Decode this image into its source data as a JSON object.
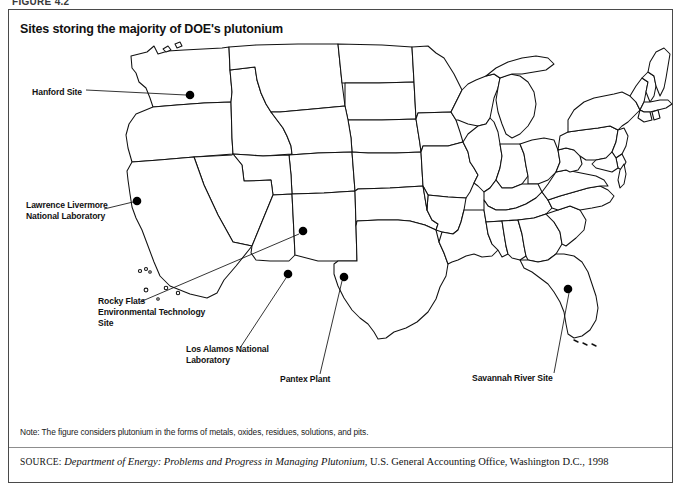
{
  "figure": {
    "number_label": "FIGURE 4.2",
    "title": "Sites storing the majority of DOE's plutonium",
    "note": "Note: The figure considers plutonium in the forms of metals, oxides, residues, solutions, and pits.",
    "source": {
      "label": "SOURCE:",
      "title": "Department of Energy: Problems and Progress in Managing Plutonium",
      "rest": ", U.S. General Accounting Office, Washington D.C., 1998"
    }
  },
  "map": {
    "region": "United States",
    "sites": [
      {
        "id": "hanford",
        "label_lines": [
          "Hanford Site"
        ],
        "label_line1": "Hanford Site",
        "label_x": 74,
        "label_y": 52,
        "anchor": "end",
        "dot_x": 182,
        "dot_y": 55,
        "leader_x1": 78,
        "leader_y1": 50,
        "leader_x2": 178,
        "leader_y2": 55
      },
      {
        "id": "lawrence-livermore",
        "label_lines": [
          "Lawrence Livermore",
          "National Laboratory"
        ],
        "label_line1": "Lawrence Livermore",
        "label_line2": "National Laboratory",
        "label_x": 18,
        "label_y": 172,
        "anchor": "start",
        "dot_x": 129,
        "dot_y": 161,
        "leader_x1": 96,
        "leader_y1": 169,
        "leader_x2": 125,
        "leader_y2": 162
      },
      {
        "id": "rocky-flats",
        "label_lines": [
          "Rocky Flats",
          "Environmental Technology",
          "Site"
        ],
        "label_line1": "Rocky Flats",
        "label_line2": "Environmental Technology",
        "label_line3": "Site",
        "label_x": 90,
        "label_y": 268,
        "anchor": "start",
        "dot_x": 295,
        "dot_y": 191,
        "leader_x1": 132,
        "leader_y1": 262,
        "leader_x2": 291,
        "leader_y2": 194
      },
      {
        "id": "los-alamos",
        "label_lines": [
          "Los Alamos National",
          "Laboratory"
        ],
        "label_line1": "Los Alamos National",
        "label_line2": "Laboratory",
        "label_x": 178,
        "label_y": 316,
        "anchor": "start",
        "dot_x": 280,
        "dot_y": 234,
        "leader_x1": 232,
        "leader_y1": 308,
        "leader_x2": 278,
        "leader_y2": 238
      },
      {
        "id": "pantex",
        "label_lines": [
          "Pantex Plant"
        ],
        "label_line1": "Pantex Plant",
        "label_x": 272,
        "label_y": 342,
        "anchor": "start",
        "dot_x": 336,
        "dot_y": 237,
        "leader_x1": 312,
        "leader_y1": 334,
        "leader_x2": 334,
        "leader_y2": 241
      },
      {
        "id": "savannah-river",
        "label_lines": [
          "Savannah River Site"
        ],
        "label_line1": "Savannah River Site",
        "label_x": 464,
        "label_y": 341,
        "anchor": "start",
        "dot_x": 560,
        "dot_y": 249,
        "leader_x1": 546,
        "leader_y1": 333,
        "leader_x2": 561,
        "leader_y2": 253
      }
    ]
  }
}
